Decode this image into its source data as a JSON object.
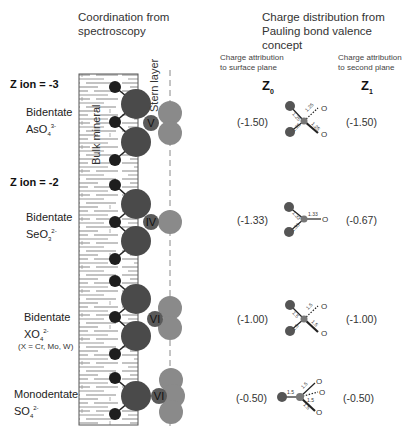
{
  "header": {
    "left_title_line1": "Coordination from",
    "left_title_line2": "spectroscopy",
    "right_title_line1": "Charge distribution from",
    "right_title_line2": "Pauling bond valence concept",
    "z0_caption_line1": "Charge attribution",
    "z0_caption_line2": "to surface plane",
    "z1_caption_line1": "Charge attribution",
    "z1_caption_line2": "to second plane",
    "z0_label": "Z",
    "z0_sub": "0",
    "z1_label": "Z",
    "z1_sub": "1"
  },
  "labels": {
    "bulk_mineral": "Bulk mineral",
    "stern_layer": "Stern layer"
  },
  "groups": [
    {
      "z_ion": "Z ion = -3",
      "coordination": "Bidentate",
      "ion": "AsO",
      "ion_sub": "4",
      "ion_sup": "3-",
      "note": "",
      "oxidation": "V",
      "z0": "(-1.50)",
      "z1": "(-1.50)",
      "bonds": [
        "1.25",
        "1.25",
        "1.25",
        "1.25"
      ]
    },
    {
      "z_ion": "Z ion = -2",
      "coordination": "Bidentate",
      "ion": "SeO",
      "ion_sub": "3",
      "ion_sup": "2-",
      "note": "",
      "oxidation": "IV",
      "z0": "(-1.33)",
      "z1": "(-0.67)",
      "bonds": [
        "1.33",
        "1.33",
        "1.33"
      ]
    },
    {
      "z_ion": "",
      "coordination": "Bidentate",
      "ion": "XO",
      "ion_sub": "4",
      "ion_sup": "2-",
      "note": "(X = Cr, Mo, W)",
      "oxidation": "VI",
      "z0": "(-1.00)",
      "z1": "(-1.00)",
      "bonds": [
        "1.5",
        "1.5",
        "1.5",
        "1.5"
      ]
    },
    {
      "z_ion": "",
      "coordination": "Monodentate",
      "ion": "SO",
      "ion_sub": "4",
      "ion_sup": "2-",
      "note": "",
      "oxidation": "VI",
      "z0": "(-0.50)",
      "z1": "(-0.50)",
      "bonds": [
        "1.5",
        "1.5",
        "1.5",
        "1.5"
      ]
    }
  ],
  "colors": {
    "metal_large": "#4a4a4a",
    "surface_oxygen": "#1e1e1e",
    "ligand_oxygen": "#8a8a8a",
    "central_atom": "#5a5a5a",
    "hatch": "#9a9a9a",
    "dashed_line": "#888888"
  }
}
